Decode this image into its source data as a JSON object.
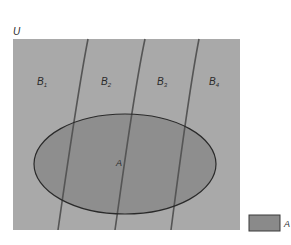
{
  "diagram": {
    "universe": {
      "label": "U",
      "fill": "#a9a9a9",
      "x": 13,
      "y": 39,
      "width": 227,
      "height": 191
    },
    "partitions": [
      {
        "label": "B",
        "subscript": "1",
        "label_x": 42,
        "label_y": 82
      },
      {
        "label": "B",
        "subscript": "2",
        "label_x": 103,
        "label_y": 82
      },
      {
        "label": "B",
        "subscript": "3",
        "label_x": 159,
        "label_y": 82
      },
      {
        "label": "B",
        "subscript": "4",
        "label_x": 210,
        "label_y": 82
      }
    ],
    "boundaries": [
      {
        "top_x": 88,
        "bottom_x": 58
      },
      {
        "top_x": 145,
        "bottom_x": 115
      },
      {
        "top_x": 199,
        "bottom_x": 171
      }
    ],
    "set_a": {
      "label": "A",
      "fill": "#8e8e8e",
      "stroke": "#2a2a2a",
      "cx": 125,
      "cy": 164,
      "rx": 91,
      "ry": 50
    },
    "legend": {
      "swatch_fill": "#8a8a8a",
      "label": "A"
    },
    "colors": {
      "background": "#ffffff",
      "curve": "#555555"
    }
  }
}
